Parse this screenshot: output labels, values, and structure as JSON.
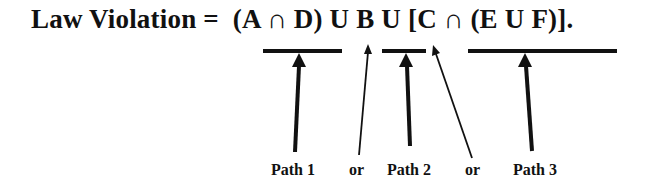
{
  "equation": {
    "lhs": "Law Violation =",
    "rhs": "(A ∩ D) U B U [C ∩ (E U F)].",
    "full": "Law Violation =  (A ∩ D) U B U [C ∩ (E U F)]."
  },
  "underlines": [
    {
      "term": "(A ∩ D)",
      "label": "Path 1"
    },
    {
      "term": "B",
      "label": "Path 2"
    },
    {
      "term": "[C ∩ (E U F)]",
      "label": "Path 3"
    }
  ],
  "labels": {
    "path1": "Path 1",
    "or1": "or",
    "path2": "Path 2",
    "or2": "or",
    "path3": "Path 3"
  }
}
